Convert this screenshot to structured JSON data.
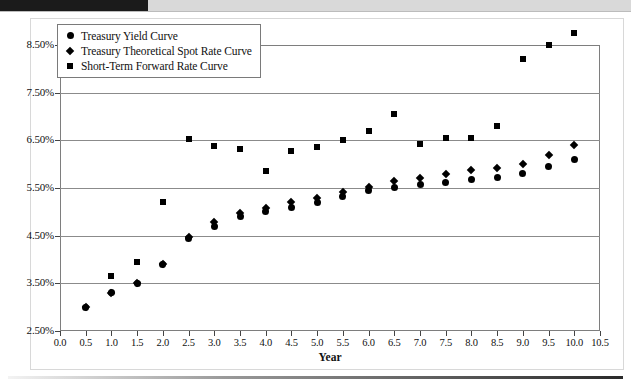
{
  "chart_data": {
    "type": "scatter",
    "title": "",
    "xlabel": "Year",
    "ylabel": "",
    "xlim": [
      0.0,
      10.5
    ],
    "ylim": [
      2.5,
      8.5
    ],
    "grid": true,
    "legend_position": "top-left",
    "x_ticks": [
      "0.0",
      "0.5",
      "1.0",
      "1.5",
      "2.0",
      "2.5",
      "3.0",
      "3.5",
      "4.0",
      "4.5",
      "5.0",
      "5.5",
      "6.0",
      "6.5",
      "7.0",
      "7.5",
      "8.0",
      "8.5",
      "9.0",
      "9.5",
      "10.0",
      "10.5"
    ],
    "y_ticks": [
      "2.50%",
      "3.50%",
      "4.50%",
      "5.50%",
      "6.50%",
      "7.50%",
      "8.50%"
    ],
    "series": [
      {
        "name": "Treasury Yield Curve",
        "marker": "circle",
        "x": [
          0.5,
          1.0,
          1.5,
          2.0,
          2.5,
          3.0,
          3.5,
          4.0,
          4.5,
          5.0,
          5.5,
          6.0,
          6.5,
          7.0,
          7.5,
          8.0,
          8.5,
          9.0,
          9.5,
          10.0
        ],
        "y": [
          3.0,
          3.3,
          3.5,
          3.9,
          4.45,
          4.7,
          4.9,
          5.0,
          5.1,
          5.2,
          5.32,
          5.45,
          5.52,
          5.58,
          5.62,
          5.68,
          5.72,
          5.8,
          5.95,
          6.1
        ]
      },
      {
        "name": "Treasury Theoretical Spot Rate Curve",
        "marker": "diamond",
        "x": [
          0.5,
          1.0,
          1.5,
          2.0,
          2.5,
          3.0,
          3.5,
          4.0,
          4.5,
          5.0,
          5.5,
          6.0,
          6.5,
          7.0,
          7.5,
          8.0,
          8.5,
          9.0,
          9.5,
          10.0
        ],
        "y": [
          3.0,
          3.3,
          3.5,
          3.9,
          4.48,
          4.78,
          4.98,
          5.08,
          5.2,
          5.3,
          5.42,
          5.52,
          5.65,
          5.72,
          5.8,
          5.88,
          5.92,
          6.0,
          6.2,
          6.4
        ]
      },
      {
        "name": "Short-Term Forward Rate Curve",
        "marker": "square",
        "x": [
          1.0,
          1.5,
          2.0,
          2.5,
          3.0,
          3.5,
          4.0,
          4.5,
          5.0,
          5.5,
          6.0,
          6.5,
          7.0,
          7.5,
          8.0,
          8.5,
          9.0,
          9.5,
          10.0
        ],
        "y": [
          3.65,
          3.95,
          5.2,
          6.52,
          6.38,
          6.32,
          5.85,
          6.28,
          6.35,
          6.5,
          6.7,
          7.05,
          6.42,
          6.55,
          6.55,
          6.8,
          8.2,
          8.5,
          8.75
        ]
      }
    ]
  },
  "legend": {
    "items": [
      {
        "marker": "circle",
        "label": "Treasury Yield Curve"
      },
      {
        "marker": "diamond",
        "label": "Treasury Theoretical Spot Rate Curve"
      },
      {
        "marker": "square",
        "label": "Short-Term Forward Rate Curve"
      }
    ]
  }
}
